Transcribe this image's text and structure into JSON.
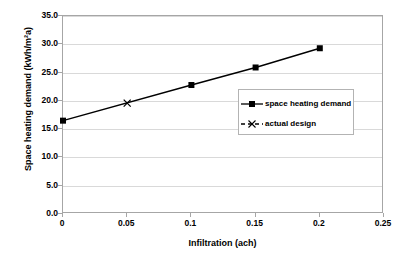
{
  "chart_data": {
    "type": "line",
    "title": "",
    "xlabel": "Infiltration (ach)",
    "ylabel": "Space heating demand (kWh/m²a)",
    "xlim": [
      0,
      0.25
    ],
    "ylim": [
      0,
      35
    ],
    "xticks": [
      "0",
      "0.05",
      "0.1",
      "0.15",
      "0.2",
      "0.25"
    ],
    "xtick_values": [
      0,
      0.05,
      0.1,
      0.15,
      0.2,
      0.25
    ],
    "yticks": [
      "0.0",
      "5.0",
      "10.0",
      "15.0",
      "20.0",
      "25.0",
      "30.0",
      "35.0"
    ],
    "ytick_values": [
      0,
      5,
      10,
      15,
      20,
      25,
      30,
      35
    ],
    "grid": "horizontal",
    "legend_position": "center-right",
    "series": [
      {
        "name": "space heating demand",
        "marker": "square",
        "color": "#000000",
        "x": [
          0,
          0.1,
          0.15,
          0.2
        ],
        "values": [
          16.5,
          22.8,
          25.9,
          29.3
        ]
      },
      {
        "name": "actual design",
        "marker": "x",
        "color": "#000000",
        "x": [
          0.05
        ],
        "values": [
          19.6
        ]
      }
    ]
  },
  "legend": {
    "items": [
      {
        "label": "space heating demand",
        "marker": "square-line"
      },
      {
        "label": "actual design",
        "marker": "x-dashed"
      }
    ]
  },
  "axes": {
    "x_title": "Infiltration (ach)",
    "y_title": "Space heating demand (kWh/m²a)"
  }
}
